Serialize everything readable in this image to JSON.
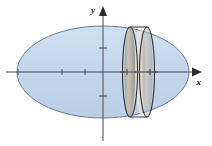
{
  "figure": {
    "background_color": "#ffffff",
    "axes": {
      "x_label": "x",
      "y_label": "y",
      "axis_color": "#4a4a52",
      "origin": {
        "x": 103,
        "y": 72
      },
      "x_axis": {
        "start_x": 6,
        "end_x": 200,
        "y": 72
      },
      "y_axis": {
        "x": 103,
        "start_y": 8,
        "end_y": 140
      },
      "x_ticks": [
        18,
        62,
        85,
        127,
        150
      ],
      "y_ticks": [
        48,
        96
      ],
      "tick_length": 7,
      "arrow_x": {
        "x": 196,
        "y": 72
      },
      "arrow_y": {
        "x": 103,
        "y": 10
      }
    },
    "ellipse": {
      "name": "ellipsoid-outline",
      "center_x": 103,
      "center_y": 72,
      "radius_x": 86,
      "radius_y": 46,
      "fill_color": "#c3d7ec",
      "stroke_color": "#5b6e86",
      "stroke_width": 0.9,
      "opacity": 0.95
    },
    "slice": {
      "name": "disk-slice",
      "description": "vertical washer/disk slab through the solid of revolution",
      "left_face_cx": 130,
      "right_face_cx": 147,
      "face_cy": 72,
      "face_rx": 7.5,
      "face_ry": 45,
      "band_fill": "#b9b4ad",
      "highlight_fill": "#e9e6e0",
      "stroke_color": "#2e2e33",
      "stroke_width": 1.1
    },
    "colors": {
      "solid_fill": "#c3d7ec",
      "solid_stroke": "#5b6e86",
      "slab_gray": "#b9b4ad",
      "slab_light": "#e9e6e0",
      "axis": "#4a4a52",
      "label": "#1b1b1b"
    }
  }
}
